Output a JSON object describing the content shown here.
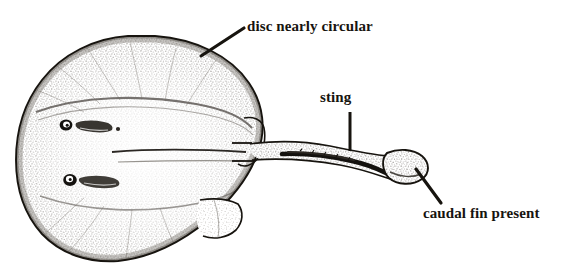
{
  "figure": {
    "kind": "scientific-line-illustration",
    "background_color": "#ffffff",
    "ink_color": "#17140f",
    "stipple_color": "#4a4540"
  },
  "annotations": [
    {
      "id": "disc",
      "label": "disc nearly circular",
      "leader": {
        "from_x": 201,
        "from_y": 56,
        "to_x": 244,
        "to_y": 28
      }
    },
    {
      "id": "sting",
      "label": "sting",
      "leader": {
        "from_x": 350,
        "from_y": 151,
        "to_x": 350,
        "to_y": 112
      }
    },
    {
      "id": "caudal",
      "label": "caudal fin present",
      "leader": {
        "from_x": 416,
        "from_y": 169,
        "to_x": 441,
        "to_y": 203
      }
    }
  ],
  "anatomy": {
    "disc": "nearly circular pectoral disc",
    "eye": "eye",
    "spiracle": "spiracle",
    "pelvic_fin": "pelvic fin",
    "tail": "tail",
    "sting": "caudal sting (serrated spine)",
    "caudal_fin": "rounded caudal fin"
  }
}
